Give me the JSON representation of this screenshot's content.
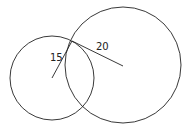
{
  "diagram": {
    "small_circle": {
      "cx": 52,
      "cy": 78,
      "r": 42,
      "label": "15"
    },
    "large_circle": {
      "cx": 123,
      "cy": 65,
      "r": 58,
      "label": "20"
    },
    "intersection": {
      "x": 72,
      "y": 41
    },
    "stroke_color": "#222222"
  }
}
